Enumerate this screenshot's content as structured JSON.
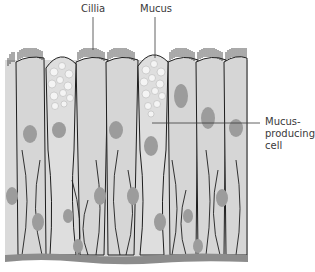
{
  "diagram": {
    "labels": {
      "cilia": "Cillia",
      "mucus": "Mucus",
      "mucus_cell_line1": "Mucus-",
      "mucus_cell_line2": "producing",
      "mucus_cell_line3": "cell"
    },
    "colors": {
      "background": "#ffffff",
      "cell_fill": "#d4d4d4",
      "cell_light": "#e0e0e0",
      "outline": "#1e1e1e",
      "nucleus": "#9a9a9a",
      "mucus_fill": "#f2f2f2",
      "basement": "#8a8a8a"
    }
  }
}
